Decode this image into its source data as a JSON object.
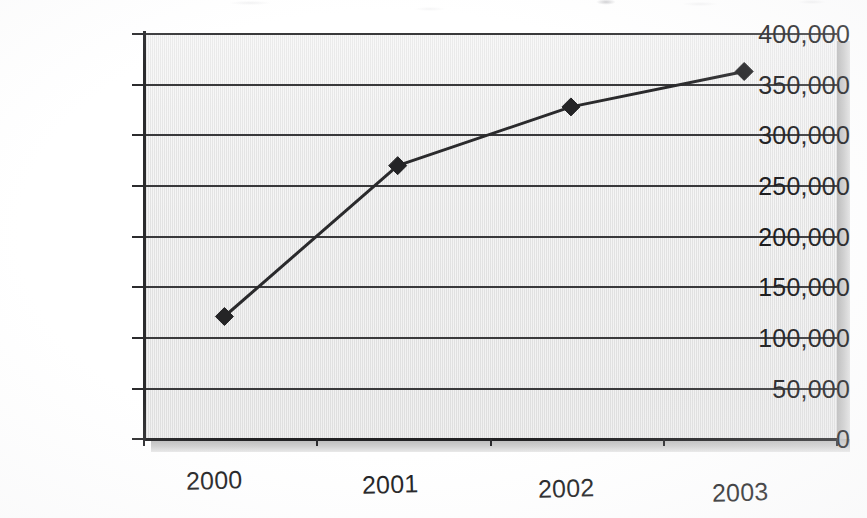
{
  "chart_data": {
    "type": "line",
    "title": "",
    "xlabel": "",
    "ylabel": "",
    "categories": [
      "2000",
      "2001",
      "2002",
      "2003"
    ],
    "values": [
      120000,
      269000,
      327000,
      362000
    ],
    "series": [
      {
        "name": "",
        "values": [
          120000,
          269000,
          327000,
          362000
        ]
      }
    ],
    "ylim": [
      0,
      400000
    ],
    "y_ticks": [
      0,
      50000,
      100000,
      150000,
      200000,
      250000,
      300000,
      350000,
      400000
    ],
    "y_tick_labels": [
      "400,000",
      "350,000",
      "300,000",
      "250,000",
      "200,000",
      "150,000",
      "100,000",
      "50,000",
      "0"
    ],
    "x_tick_labels": [
      "2000",
      "2001",
      "2002",
      "2003"
    ],
    "grid": true,
    "grid_axis": "y",
    "legend": false,
    "legend_position": "none",
    "marker": "diamond",
    "annotations": [],
    "colors": {
      "plot_background": "#e9e9e9",
      "gridline": "#39393b",
      "axis": "#2b2b2d",
      "series_line": "#2a2a2c",
      "marker_fill": "#242426",
      "shadow": "#c2c2c2",
      "text": "#1b1b1d",
      "page_background": "#ffffff"
    }
  },
  "axes": {
    "y_labels": [
      {
        "text": "400,000",
        "value": 400000
      },
      {
        "text": "350,000",
        "value": 350000
      },
      {
        "text": "300,000",
        "value": 300000
      },
      {
        "text": "250,000",
        "value": 250000
      },
      {
        "text": "200,000",
        "value": 200000
      },
      {
        "text": "150,000",
        "value": 150000
      },
      {
        "text": "100,000",
        "value": 100000
      },
      {
        "text": "50,000",
        "value": 50000
      },
      {
        "text": "0",
        "value": 0
      }
    ],
    "x_labels": [
      {
        "text": "2000"
      },
      {
        "text": "2001"
      },
      {
        "text": "2002"
      },
      {
        "text": "2003"
      }
    ]
  }
}
